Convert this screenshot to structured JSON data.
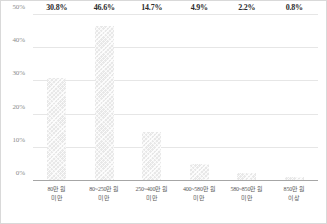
{
  "chart_data": {
    "type": "bar",
    "title": "",
    "subtitle": "",
    "xlabel": "",
    "ylabel": "",
    "ylim": [
      0,
      50
    ],
    "grid": true,
    "legend": null,
    "categories": [
      "80만 원 미만",
      "80~250만 원 미만",
      "250~400만 원 미만",
      "400~580만 원 미만",
      "580~850만 원 미만",
      "850만 원 이상"
    ],
    "category_lines": [
      {
        "line1": "80만 원",
        "line2": "미만"
      },
      {
        "line1": "80~250만 원",
        "line2": "미만"
      },
      {
        "line1": "250~400만 원",
        "line2": "미만"
      },
      {
        "line1": "400~580만 원",
        "line2": "미만"
      },
      {
        "line1": "580~850만 원",
        "line2": "미만"
      },
      {
        "line1": "850만 원",
        "line2": "이상"
      }
    ],
    "values": [
      30.8,
      46.6,
      14.7,
      4.9,
      2.2,
      0.8
    ],
    "value_labels": [
      "30.8%",
      "46.6%",
      "14.7%",
      "4.9%",
      "2.2%",
      "0.8%"
    ],
    "yticks": [
      0,
      10,
      20,
      30,
      40,
      50
    ],
    "ytick_labels": [
      "0%",
      "10%",
      "20%",
      "30%",
      "40%",
      "50%"
    ],
    "colors": {
      "bar": "#E8E8E8",
      "gridline": "#E6E6E6",
      "axis": "#A6A6A6",
      "value_text": "#2B2B2B",
      "tick_text": "#8C8C8C",
      "category_text": "#595959",
      "background": "#FFFFFF",
      "border": "#D9D9D9"
    }
  }
}
